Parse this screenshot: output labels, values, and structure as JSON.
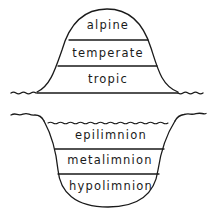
{
  "diagram": {
    "colors": {
      "stroke": "#1a1a1a",
      "background": "#ffffff"
    },
    "mountain": {
      "zones": [
        {
          "label": "alpine"
        },
        {
          "label": "temperate"
        },
        {
          "label": "tropic"
        }
      ]
    },
    "lake": {
      "zones": [
        {
          "label": "epilimnion"
        },
        {
          "label": "metalimnion"
        },
        {
          "label": "hypolimnion"
        }
      ]
    }
  }
}
